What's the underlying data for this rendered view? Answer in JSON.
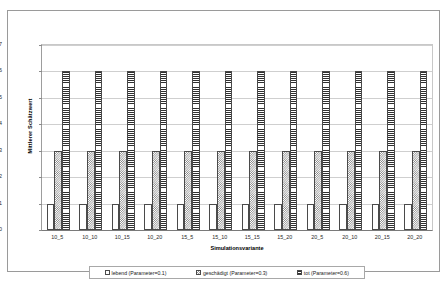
{
  "chart_data": {
    "type": "bar",
    "title": "",
    "xlabel": "Simulationsvariante",
    "ylabel": "Mittlerer Schätzwert",
    "ylim": [
      0,
      0.7
    ],
    "ytick_labels": [
      "0.0",
      "0.1",
      "0.2",
      "0.3",
      "0.4",
      "0.5",
      "0.6",
      "0.7"
    ],
    "ytick_values": [
      0.0,
      0.1,
      0.2,
      0.3,
      0.4,
      0.5,
      0.6,
      0.7
    ],
    "grid": true,
    "legend_position": "bottom",
    "categories": [
      "10_5",
      "10_10",
      "10_15",
      "10_20",
      "15_5",
      "15_10",
      "15_15",
      "15_20",
      "20_5",
      "20_10",
      "20_15",
      "20_20"
    ],
    "series": [
      {
        "name": "lebend (Parameter=0.1)",
        "pattern": "sparse-dots",
        "values": [
          0.1,
          0.1,
          0.1,
          0.1,
          0.1,
          0.1,
          0.1,
          0.1,
          0.1,
          0.1,
          0.1,
          0.1
        ]
      },
      {
        "name": "geschädigt (Parameter=0.3)",
        "pattern": "checker",
        "values": [
          0.3,
          0.3,
          0.3,
          0.3,
          0.3,
          0.3,
          0.3,
          0.3,
          0.3,
          0.3,
          0.3,
          0.3
        ]
      },
      {
        "name": "tot (Parameter=0.6)",
        "pattern": "horizontal-stripes",
        "values": [
          0.6,
          0.6,
          0.6,
          0.6,
          0.6,
          0.6,
          0.6,
          0.6,
          0.6,
          0.6,
          0.6,
          0.6
        ]
      }
    ]
  },
  "colors": {
    "plot_background": "#ffffff",
    "gridline": "#cfcfcf",
    "axis": "#7a7a7a",
    "frame_border": "#9a9a9a",
    "bar_outline": "#4a4a4a",
    "text": "#1a1a1a"
  }
}
